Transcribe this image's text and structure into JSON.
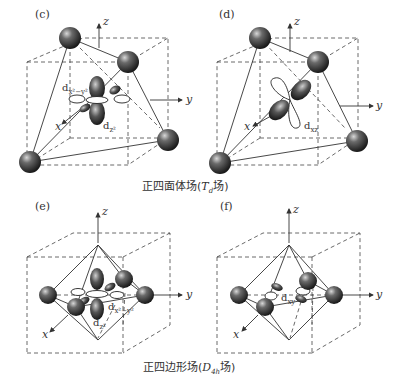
{
  "figure": {
    "panels": [
      {
        "id": "c",
        "label": "(c)",
        "geometry": "tetrahedral",
        "axes": {
          "x": "x",
          "y": "y",
          "z": "z"
        },
        "orbitals": [
          {
            "name": "dx2-y2",
            "label_main": "d",
            "label_sub": "x²−y²"
          },
          {
            "name": "dz2",
            "label_main": "d",
            "label_sub": "z²"
          }
        ]
      },
      {
        "id": "d",
        "label": "(d)",
        "geometry": "tetrahedral",
        "axes": {
          "x": "x",
          "y": "y",
          "z": "z"
        },
        "orbitals": [
          {
            "name": "dxz",
            "label_main": "d",
            "label_sub": "xz"
          }
        ]
      },
      {
        "id": "e",
        "label": "(e)",
        "geometry": "square-planar",
        "axes": {
          "x": "x",
          "y": "y",
          "z": "z"
        },
        "orbitals": [
          {
            "name": "dz2",
            "label_main": "d",
            "label_sub": "z²"
          },
          {
            "name": "dx2-y2",
            "label_main": "d",
            "label_sub": "x²−y²"
          }
        ]
      },
      {
        "id": "f",
        "label": "(f)",
        "geometry": "square-planar",
        "axes": {
          "x": "x",
          "y": "y",
          "z": "z"
        },
        "orbitals": [
          {
            "name": "dxy",
            "label_main": "d",
            "label_sub": "xy"
          }
        ]
      }
    ],
    "captions": {
      "top": {
        "prefix": "正四面体场(",
        "symbol": "T",
        "symbol_sub": "d",
        "suffix": "场)"
      },
      "bottom": {
        "prefix": "正四边形场(",
        "symbol": "D",
        "symbol_sub": "4h",
        "suffix": "场)"
      }
    }
  }
}
